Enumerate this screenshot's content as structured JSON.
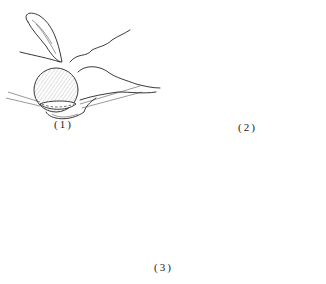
{
  "figure": {
    "panels": [
      {
        "id": "1",
        "label": "(1)",
        "description": "Gallbladder with sutures placed around anastomosis, stomach and duodenum"
      },
      {
        "id": "2",
        "label": "(2)",
        "description": "Completed anastomosis with intestinal loop"
      },
      {
        "id": "3",
        "label": "(3)",
        "description": "Liver, stomach and intestinal loop overview with dashed line"
      }
    ]
  }
}
